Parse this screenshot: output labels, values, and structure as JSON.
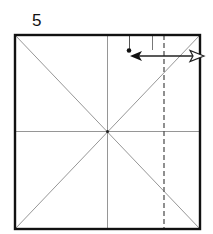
{
  "diagram": {
    "step_number": "5",
    "type": "origami-fold-step",
    "square": {
      "x": 15,
      "y": 35,
      "size": 185
    },
    "crease_lines": [
      "vertical-center",
      "horizontal-center",
      "diagonal-tl-br",
      "diagonal-tr-bl"
    ],
    "fold_line": {
      "style": "valley-dashed",
      "x": 164
    },
    "arrow": {
      "from_x": 203,
      "to_x": 131,
      "y": 56,
      "direction": "left",
      "tail_style": "hollow",
      "head_style": "filled"
    },
    "reference_mark": {
      "x": 129,
      "y": 51
    },
    "colors": {
      "outline": "#111111",
      "crease": "#8a8a8a",
      "fold": "#555555",
      "arrow": "#222222"
    }
  }
}
